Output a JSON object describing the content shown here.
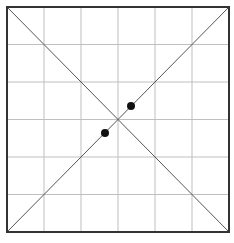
{
  "diagram": {
    "type": "grid-with-diagonals",
    "grid": {
      "rows": 6,
      "cols": 6,
      "line_color": "#bfbfbf"
    },
    "border": {
      "x": 7,
      "y": 7,
      "width": 222,
      "height": 225,
      "color": "#333333"
    },
    "diagonals": [
      {
        "from": "top-left",
        "to": "bottom-right"
      },
      {
        "from": "bottom-left",
        "to": "top-right"
      }
    ],
    "points": [
      {
        "x": 131,
        "y": 106
      },
      {
        "x": 105,
        "y": 133
      }
    ],
    "point_color": "#111111"
  }
}
